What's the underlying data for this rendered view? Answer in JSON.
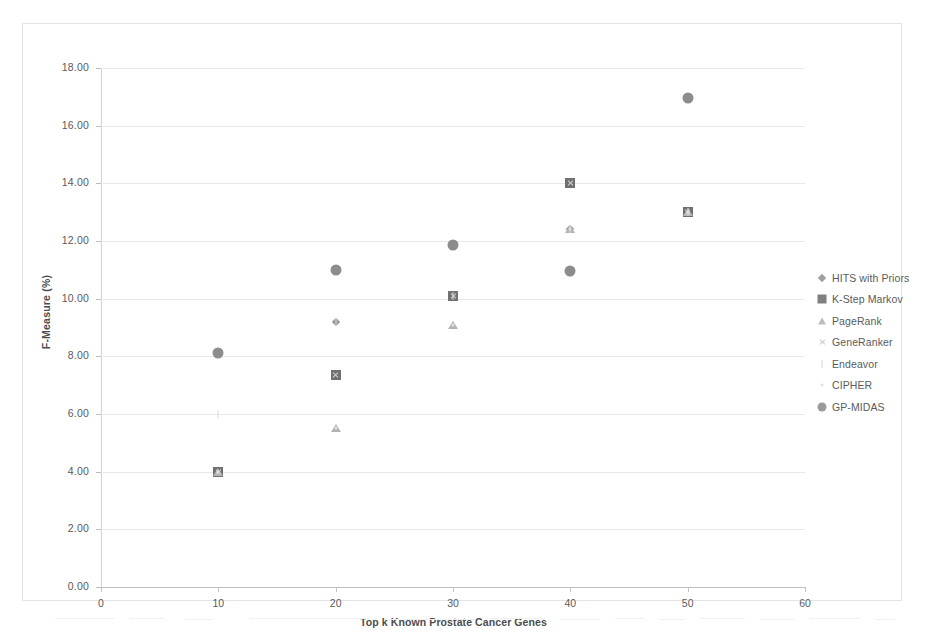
{
  "chart_data": {
    "type": "scatter",
    "title": "",
    "xlabel": "Top k Known Prostate Cancer Genes",
    "ylabel": "F-Measure (%)",
    "xlim": [
      0,
      60
    ],
    "ylim": [
      0,
      18
    ],
    "xticks": [
      "0",
      "10",
      "20",
      "30",
      "40",
      "50",
      "60"
    ],
    "xtick_values": [
      0,
      10,
      20,
      30,
      40,
      50,
      60
    ],
    "yticks": [
      "0.00",
      "2.00",
      "4.00",
      "6.00",
      "8.00",
      "10.00",
      "12.00",
      "14.00",
      "16.00",
      "18.00"
    ],
    "ytick_values": [
      0,
      2,
      4,
      6,
      8,
      10,
      12,
      14,
      16,
      18
    ],
    "grid": "horizontal",
    "legend_position": "right",
    "x": [
      10,
      20,
      30,
      40,
      50
    ],
    "series": [
      {
        "name": "HITS with Priors",
        "marker": "diamond",
        "color": "#9a9a9c",
        "values": [
          4.0,
          9.2,
          10.1,
          12.4,
          13.0
        ]
      },
      {
        "name": "K-Step Markov",
        "marker": "square",
        "color": "#707072",
        "values": [
          4.0,
          7.35,
          10.1,
          14.0,
          13.0
        ]
      },
      {
        "name": "PageRank",
        "marker": "triangle",
        "color": "#b3b3b5",
        "values": [
          4.0,
          5.5,
          9.1,
          12.4,
          13.0
        ]
      },
      {
        "name": "GeneRanker",
        "marker": "x",
        "color": "#d0d0d2",
        "values": [
          4.0,
          7.35,
          10.1,
          14.0,
          13.0
        ]
      },
      {
        "name": "Endeavor",
        "marker": "tick",
        "color": "#dcdcde",
        "values": [
          6.0,
          9.2,
          10.1,
          12.4,
          13.0
        ]
      },
      {
        "name": "CIPHER",
        "marker": "dot",
        "color": "#e2e2e4",
        "values": [
          4.0,
          5.5,
          9.1,
          12.4,
          13.0
        ]
      },
      {
        "name": "GP-MIDAS",
        "marker": "circle",
        "color": "#8c8c8e",
        "values": [
          8.1,
          11.0,
          11.85,
          10.95,
          16.95
        ]
      }
    ]
  },
  "legend": {
    "items": [
      {
        "label": "HITS with Priors",
        "marker": "diamond",
        "color": "#a0a0a2"
      },
      {
        "label": "K-Step Markov",
        "marker": "square",
        "color": "#808082"
      },
      {
        "label": "PageRank",
        "marker": "triangle",
        "color": "#bcbcbe"
      },
      {
        "label": "GeneRanker",
        "marker": "x",
        "color": "#cbcbcd"
      },
      {
        "label": "Endeavor",
        "marker": "tick",
        "color": "#d8d8da"
      },
      {
        "label": "CIPHER",
        "marker": "dot",
        "color": "#e0e0e2"
      },
      {
        "label": "GP-MIDAS",
        "marker": "circle",
        "color": "#9a9a9c"
      }
    ]
  },
  "colors": {
    "grid": "#e8e8ea",
    "axis": "#bfbfc1",
    "text": "#58585a",
    "frame": "#e4e4e6"
  }
}
